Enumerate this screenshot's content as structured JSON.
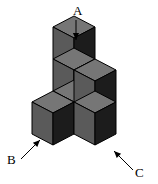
{
  "figure": {
    "name": "isometric-cube-stack-diagram",
    "background_color": "#ffffff",
    "cube_colors": {
      "top_face": "#767676",
      "left_face": "#5a5a5a",
      "right_face": "#1c1c1c",
      "edge": "#000000"
    },
    "projection": {
      "half_width": 21,
      "half_height": 11,
      "cube_height": 32,
      "origin_x": 74,
      "origin_y": 112
    },
    "cubes": [
      {
        "id": "cube-b",
        "gx": 1,
        "gy": 0,
        "gz": 0
      },
      {
        "id": "cube-center",
        "gx": 0,
        "gy": 0,
        "gz": 0
      },
      {
        "id": "cube-c",
        "gx": 0,
        "gy": 1,
        "gz": 0
      },
      {
        "id": "cube-middle",
        "gx": 0,
        "gy": 0,
        "gz": 1
      },
      {
        "id": "cube-middle-right",
        "gx": 0,
        "gy": 1,
        "gz": 1
      },
      {
        "id": "cube-a",
        "gx": 0,
        "gy": 0,
        "gz": 2
      }
    ],
    "labels": [
      {
        "id": "label-a",
        "text": "A",
        "text_x": 73,
        "text_y": 15,
        "arrow": {
          "x1": 76,
          "y1": 20,
          "x2": 76,
          "y2": 40,
          "head_size": 4
        }
      },
      {
        "id": "label-b",
        "text": "B",
        "text_x": 7,
        "text_y": 164,
        "arrow": {
          "x1": 21,
          "y1": 159,
          "x2": 40,
          "y2": 140,
          "head_size": 4
        }
      },
      {
        "id": "label-c",
        "text": "C",
        "text_x": 135,
        "text_y": 177,
        "arrow": {
          "x1": 133,
          "y1": 170,
          "x2": 114,
          "y2": 151,
          "head_size": 4
        }
      }
    ]
  }
}
